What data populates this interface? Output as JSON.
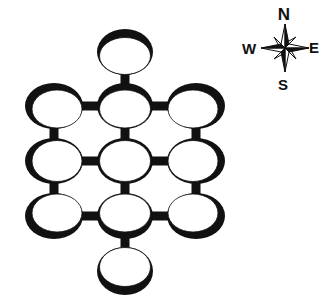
{
  "diagram": {
    "type": "grid-of-rooms",
    "colors": {
      "ink": "#111111",
      "background": "#ffffff"
    },
    "rooms": [
      {
        "id": "r0",
        "cx": 125,
        "cy": 52,
        "rx": 28,
        "ry": 23
      },
      {
        "id": "r1",
        "cx": 54,
        "cy": 106,
        "rx": 29,
        "ry": 23
      },
      {
        "id": "r2",
        "cx": 125,
        "cy": 106,
        "rx": 28,
        "ry": 23
      },
      {
        "id": "r3",
        "cx": 196,
        "cy": 106,
        "rx": 29,
        "ry": 23
      },
      {
        "id": "r4",
        "cx": 54,
        "cy": 161,
        "rx": 29,
        "ry": 23
      },
      {
        "id": "r5",
        "cx": 125,
        "cy": 161,
        "rx": 28,
        "ry": 23
      },
      {
        "id": "r6",
        "cx": 196,
        "cy": 161,
        "rx": 29,
        "ry": 23
      },
      {
        "id": "r7",
        "cx": 54,
        "cy": 216,
        "rx": 29,
        "ry": 23
      },
      {
        "id": "r8",
        "cx": 125,
        "cy": 216,
        "rx": 28,
        "ry": 23
      },
      {
        "id": "r9",
        "cx": 196,
        "cy": 216,
        "rx": 29,
        "ry": 23
      },
      {
        "id": "r10",
        "cx": 125,
        "cy": 271,
        "rx": 28,
        "ry": 24
      }
    ],
    "connectors": [
      {
        "from": "r0",
        "to": "r2",
        "orientation": "vertical"
      },
      {
        "from": "r1",
        "to": "r2",
        "orientation": "horizontal"
      },
      {
        "from": "r2",
        "to": "r3",
        "orientation": "horizontal"
      },
      {
        "from": "r1",
        "to": "r4",
        "orientation": "vertical"
      },
      {
        "from": "r2",
        "to": "r5",
        "orientation": "vertical"
      },
      {
        "from": "r3",
        "to": "r6",
        "orientation": "vertical"
      },
      {
        "from": "r4",
        "to": "r5",
        "orientation": "horizontal"
      },
      {
        "from": "r5",
        "to": "r6",
        "orientation": "horizontal"
      },
      {
        "from": "r4",
        "to": "r7",
        "orientation": "vertical"
      },
      {
        "from": "r5",
        "to": "r8",
        "orientation": "vertical"
      },
      {
        "from": "r6",
        "to": "r9",
        "orientation": "vertical"
      },
      {
        "from": "r7",
        "to": "r8",
        "orientation": "horizontal"
      },
      {
        "from": "r8",
        "to": "r9",
        "orientation": "horizontal"
      },
      {
        "from": "r8",
        "to": "r10",
        "orientation": "vertical"
      }
    ]
  },
  "compass": {
    "icon": "compass-rose-icon",
    "north": "N",
    "south": "S",
    "east": "E",
    "west": "W"
  }
}
